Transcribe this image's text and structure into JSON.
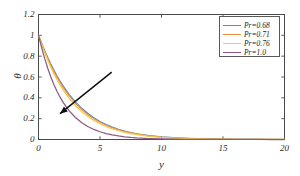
{
  "chart_data": {
    "type": "line",
    "title": "",
    "xlabel": "y",
    "ylabel": "θ",
    "xlim": [
      0,
      20
    ],
    "ylim": [
      0,
      1.2
    ],
    "xticks": [
      "0",
      "5",
      "10",
      "15",
      "20"
    ],
    "xtick_values": [
      0,
      5,
      10,
      15,
      20
    ],
    "yticks": [
      "0",
      "0.2",
      "0.4",
      "0.6",
      "0.8",
      "1",
      "1.2"
    ],
    "ytick_values": [
      0,
      0.2,
      0.4,
      0.6,
      0.8,
      1,
      1.2
    ],
    "grid": false,
    "legend_position": "top-right",
    "x": [
      0,
      0.25,
      0.5,
      0.75,
      1,
      1.25,
      1.5,
      1.75,
      2,
      2.5,
      3,
      3.5,
      4,
      4.5,
      5,
      5.5,
      6,
      6.5,
      7,
      7.5,
      8,
      9,
      10,
      11,
      12,
      13,
      14,
      15,
      16,
      17,
      18,
      19,
      20
    ],
    "series": [
      {
        "name": "Pr=0.68",
        "color": "#5b87c5",
        "values": [
          1,
          0.9245,
          0.8533,
          0.7866,
          0.7242,
          0.666,
          0.6118,
          0.5614,
          0.5146,
          0.4317,
          0.3613,
          0.3017,
          0.2513,
          0.2089,
          0.1733,
          0.1436,
          0.1188,
          0.0982,
          0.0811,
          0.0669,
          0.0551,
          0.0374,
          0.0253,
          0.0171,
          0.0116,
          0.0078,
          0.0053,
          0.0036,
          0.0024,
          0.0016,
          0.0011,
          0.0007,
          0.0005
        ]
      },
      {
        "name": "Pr=0.71",
        "color": "#e8903c",
        "values": [
          1,
          0.9207,
          0.8464,
          0.7772,
          0.7129,
          0.6534,
          0.5984,
          0.5476,
          0.5007,
          0.4181,
          0.3484,
          0.2899,
          0.2408,
          0.1997,
          0.1654,
          0.1368,
          0.1131,
          0.0934,
          0.077,
          0.0634,
          0.0521,
          0.0352,
          0.0237,
          0.0159,
          0.0107,
          0.0072,
          0.0048,
          0.0032,
          0.0022,
          0.0014,
          0.001,
          0.0006,
          0.0004
        ]
      },
      {
        "name": "Pr=0.76",
        "color": "#f2cb4a",
        "values": [
          1,
          0.9145,
          0.8351,
          0.7618,
          0.6944,
          0.6325,
          0.5758,
          0.524,
          0.4766,
          0.3943,
          0.326,
          0.2693,
          0.2223,
          0.1833,
          0.1511,
          0.1244,
          0.1024,
          0.0842,
          0.0692,
          0.0568,
          0.0465,
          0.0311,
          0.0207,
          0.0138,
          0.0092,
          0.0061,
          0.004,
          0.0027,
          0.0018,
          0.0012,
          0.0008,
          0.0005,
          0.0003
        ]
      },
      {
        "name": "Pr=1.0",
        "color": "#8a5b86",
        "values": [
          1,
          0.8847,
          0.7788,
          0.6839,
          0.6005,
          0.5273,
          0.4628,
          0.4062,
          0.3564,
          0.2744,
          0.2113,
          0.1627,
          0.1253,
          0.0965,
          0.0743,
          0.0572,
          0.044,
          0.0339,
          0.0261,
          0.0201,
          0.0155,
          0.0092,
          0.0054,
          0.0032,
          0.0019,
          0.0011,
          0.0007,
          0.0004,
          0.0002,
          0.0001,
          0.0001,
          0,
          0
        ]
      }
    ],
    "annotations": [
      {
        "type": "arrow",
        "label": "increasing-pr-arrow",
        "from": [
          5.95,
          0.646
        ],
        "to": [
          1.75,
          0.248
        ]
      }
    ]
  },
  "legend": {
    "entries": [
      {
        "label": "Pr=0.68"
      },
      {
        "label": "Pr=0.71"
      },
      {
        "label": "Pr=0.76"
      },
      {
        "label": "Pr=1.0"
      }
    ]
  },
  "axes": {
    "x_title": "y",
    "y_title": "θ",
    "x_tick_labels": [
      "0",
      "5",
      "10",
      "15",
      "20"
    ],
    "y_tick_labels": [
      "0",
      "0.2",
      "0.4",
      "0.6",
      "0.8",
      "1",
      "1.2"
    ]
  },
  "style": {
    "axis_color": "#4a4a4a",
    "background": "#ffffff",
    "annotation_color": "#111111"
  }
}
